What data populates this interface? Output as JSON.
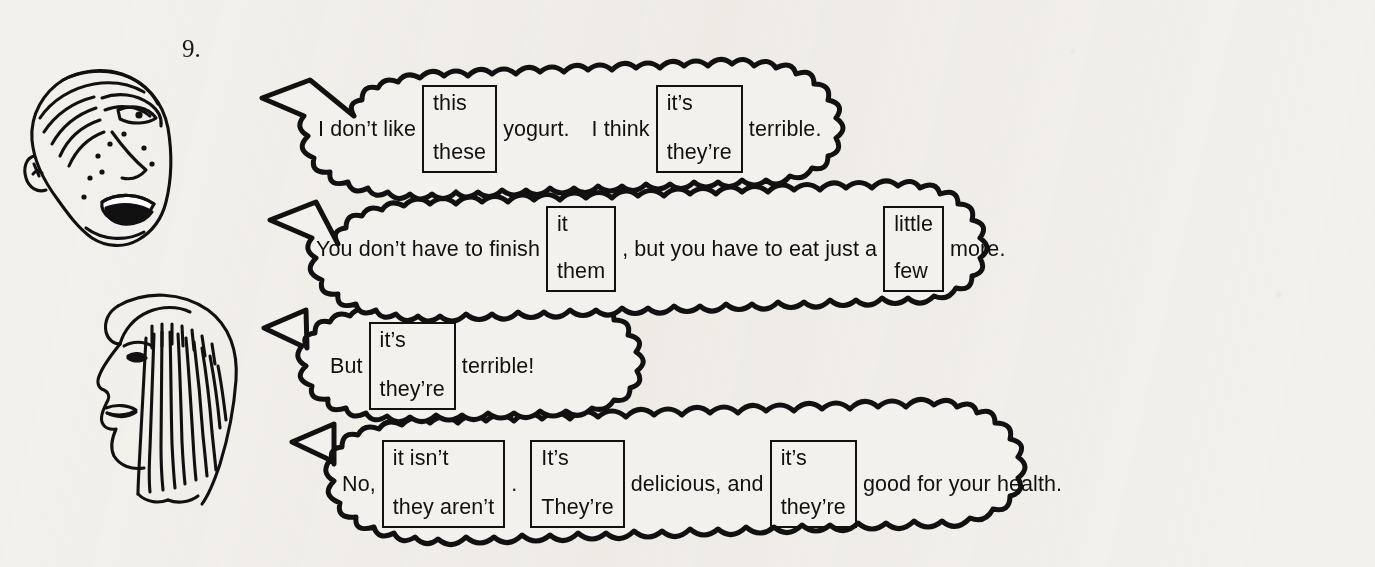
{
  "exercise": {
    "number": "9."
  },
  "characters": [
    {
      "name": "boy-face-illustration",
      "description": "boy face profile with freckles"
    },
    {
      "name": "woman-face-illustration",
      "description": "woman face profile with long hair"
    }
  ],
  "bubbles": [
    {
      "id": "bubble-1",
      "speaker": "boy",
      "segments": [
        {
          "type": "text",
          "value": "I don’t like"
        },
        {
          "type": "choice",
          "top": "this",
          "bottom": "these"
        },
        {
          "type": "text",
          "value": "yogurt."
        },
        {
          "type": "text",
          "value": "I think"
        },
        {
          "type": "choice",
          "top": "it’s",
          "bottom": "they’re"
        },
        {
          "type": "text",
          "value": "terrible."
        }
      ]
    },
    {
      "id": "bubble-2",
      "speaker": "woman",
      "segments": [
        {
          "type": "text",
          "value": "You don’t have to finish"
        },
        {
          "type": "choice",
          "top": "it",
          "bottom": "them"
        },
        {
          "type": "text",
          "value": ", but you have to eat just a"
        },
        {
          "type": "choice",
          "top": "little",
          "bottom": "few"
        },
        {
          "type": "text",
          "value": "more."
        }
      ]
    },
    {
      "id": "bubble-3",
      "speaker": "boy",
      "segments": [
        {
          "type": "text",
          "value": "But"
        },
        {
          "type": "choice",
          "top": "it’s",
          "bottom": "they’re"
        },
        {
          "type": "text",
          "value": "terrible!"
        }
      ]
    },
    {
      "id": "bubble-4",
      "speaker": "woman",
      "segments": [
        {
          "type": "text",
          "value": "No,"
        },
        {
          "type": "choice",
          "top": "it isn’t",
          "bottom": "they aren’t"
        },
        {
          "type": "text",
          "value": "."
        },
        {
          "type": "choice",
          "top": "It’s",
          "bottom": "They’re"
        },
        {
          "type": "text",
          "value": "delicious, and"
        },
        {
          "type": "choice",
          "top": "it’s",
          "bottom": "they’re"
        },
        {
          "type": "text",
          "value": "good for your health."
        }
      ]
    }
  ],
  "colors": {
    "ink": "#111111",
    "paper": "#f3f1ed"
  }
}
